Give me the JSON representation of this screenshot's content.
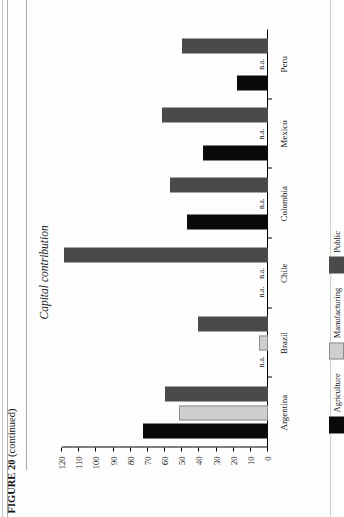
{
  "figure": {
    "label": "FIGURE 20",
    "continued": "(continued)"
  },
  "chart_data": {
    "type": "bar",
    "orientation": "horizontal",
    "title": "",
    "xlabel": "",
    "ylabel": "Capital contribution",
    "axis_title": "Capital contribution",
    "ylim": [
      0,
      120
    ],
    "tick_values": [
      0,
      10,
      20,
      30,
      40,
      50,
      60,
      70,
      80,
      90,
      100,
      110,
      120
    ],
    "tick_labels": [
      "0",
      "10",
      "20",
      "30",
      "40",
      "50",
      "60",
      "70",
      "80",
      "90",
      "100",
      "110",
      "120"
    ],
    "grid": false,
    "legend_position": "bottom-left",
    "categories": [
      "Argentina",
      "Brazil",
      "Chile",
      "Colombia",
      "Mexico",
      "Peru"
    ],
    "na_text": "n.a.",
    "series": [
      {
        "name": "Agriculture",
        "color": "#0a0a0a",
        "values": [
          73,
          null,
          null,
          47,
          38,
          18
        ],
        "na": [
          false,
          true,
          true,
          false,
          false,
          false
        ]
      },
      {
        "name": "Manufacturing",
        "color": "#cfcfcf",
        "values": [
          52,
          5,
          null,
          null,
          null,
          null
        ],
        "na": [
          false,
          false,
          true,
          true,
          true,
          true
        ]
      },
      {
        "name": "Public",
        "color": "#4a4a4a",
        "values": [
          60,
          41,
          119,
          57,
          62,
          50
        ],
        "na": [
          false,
          false,
          false,
          false,
          false,
          false
        ]
      }
    ]
  },
  "legend": {
    "items": [
      {
        "label": "Agriculture",
        "key": "agriculture"
      },
      {
        "label": "Manufacturing",
        "key": "manufacturing"
      },
      {
        "label": "Public",
        "key": "public"
      }
    ]
  }
}
